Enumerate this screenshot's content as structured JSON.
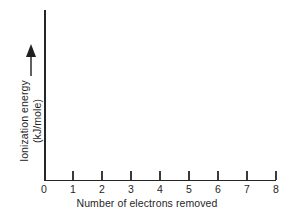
{
  "chart_data": {
    "type": "line",
    "title": "",
    "subtitle": "",
    "xlabel": "Number of electrons removed",
    "ylabel": "Ionization energy (kJ/mole)",
    "ylabel_lines": [
      "Ionization energy",
      "(kJ/mole)"
    ],
    "x_tick_labels": [
      "0",
      "1",
      "2",
      "3",
      "4",
      "5",
      "6",
      "7",
      "8"
    ],
    "x_values": [
      0,
      1,
      2,
      3,
      4,
      5,
      6,
      7,
      8
    ],
    "xlim": [
      0,
      8
    ],
    "y_tick_labels": [],
    "ylim": [
      null,
      null
    ],
    "grid": false,
    "legend": null,
    "series": [],
    "annotations": [],
    "y_axis_arrow": "up-arrow-icon",
    "note": "Blank axes template - no data plotted",
    "ink_color": "#262626",
    "background_color": "#ffffff"
  }
}
